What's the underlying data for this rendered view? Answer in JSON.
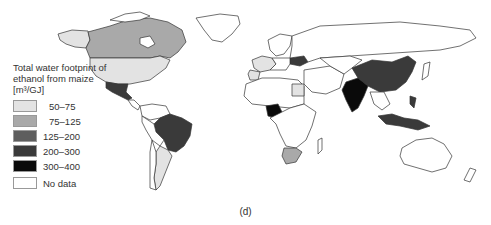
{
  "legend": {
    "title_line1": "Total water footprint of",
    "title_line2": "ethanol from maize",
    "unit": "[m³/GJ]",
    "classes": [
      {
        "label": "50–75",
        "color": "#e3e3e3"
      },
      {
        "label": "75–125",
        "color": "#a9a9a9"
      },
      {
        "label": "125–200",
        "color": "#5e5e5e"
      },
      {
        "label": "200–300",
        "color": "#3a3a3a"
      },
      {
        "label": "300–400",
        "color": "#0a0a0a"
      },
      {
        "label": "No data",
        "color": "#ffffff"
      }
    ]
  },
  "caption": "(d)",
  "regions": [
    {
      "name": "Canada",
      "class": "75–125"
    },
    {
      "name": "USA",
      "class": "50–75"
    },
    {
      "name": "Alaska",
      "class": "50–75"
    },
    {
      "name": "Mexico",
      "class": "200–300"
    },
    {
      "name": "Brazil",
      "class": "200–300"
    },
    {
      "name": "Argentina",
      "class": "50–75"
    },
    {
      "name": "Nigeria",
      "class": "300–400"
    },
    {
      "name": "South Africa",
      "class": "75–125"
    },
    {
      "name": "Egypt",
      "class": "50–75"
    },
    {
      "name": "Ukraine",
      "class": "200–300"
    },
    {
      "name": "Western Europe",
      "class": "50–75"
    },
    {
      "name": "China",
      "class": "200–300"
    },
    {
      "name": "India",
      "class": "300–400"
    },
    {
      "name": "Indonesia",
      "class": "200–300"
    },
    {
      "name": "Philippines",
      "class": "200–300"
    },
    {
      "name": "Australia",
      "class": "No data"
    }
  ]
}
